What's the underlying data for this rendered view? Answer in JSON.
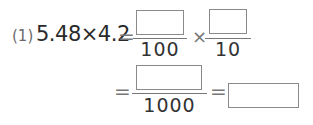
{
  "problem": {
    "number": "(1)",
    "expression": "5.48×4.2",
    "equals": "=",
    "times": "×",
    "fraction1": {
      "numerator": "",
      "denominator": "100"
    },
    "fraction2": {
      "numerator": "",
      "denominator": "10"
    },
    "fraction3": {
      "numerator": "",
      "denominator": "1000"
    },
    "answer": ""
  }
}
